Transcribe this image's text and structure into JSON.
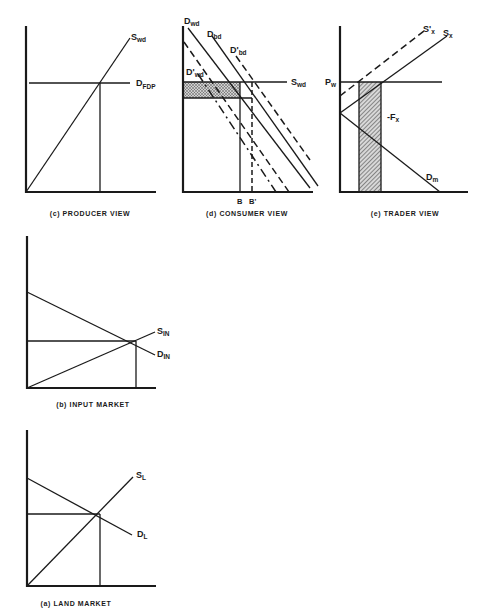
{
  "panels": {
    "c": {
      "caption": "(c) PRODUCER VIEW",
      "labels": {
        "supply": "S",
        "supply_sub": "wd",
        "demand": "D",
        "demand_sub": "FDP"
      }
    },
    "d": {
      "caption": "(d) CONSUMER VIEW",
      "labels": {
        "d_wd": "D",
        "d_wd_sub": "wd",
        "d_bd": "D",
        "d_bd_sub": "bd",
        "d_bd_prime": "D'",
        "d_bd_prime_sub": "bd",
        "d_wd_prime": "D'",
        "d_wd_prime_sub": "wd",
        "s_wd": "S",
        "s_wd_sub": "wd",
        "b": "B",
        "b_prime": "B'"
      }
    },
    "e": {
      "caption": "(e) TRADER VIEW",
      "labels": {
        "s_x_prime": "S'",
        "s_x_prime_sub": "x",
        "s_x": "S",
        "s_x_sub": "x",
        "p_w": "P",
        "p_w_sub": "w",
        "f_x": "-F",
        "f_x_sub": "x",
        "d_m": "D",
        "d_m_sub": "m"
      }
    },
    "b": {
      "caption": "(b) INPUT MARKET",
      "labels": {
        "supply": "S",
        "supply_sub": "IN",
        "demand": "D",
        "demand_sub": "IN"
      }
    },
    "a": {
      "caption": "(a) LAND MARKET",
      "labels": {
        "supply": "S",
        "supply_sub": "L",
        "demand": "D",
        "demand_sub": "L"
      }
    }
  },
  "colors": {
    "ink": "#1a1a1a",
    "background": "#ffffff"
  }
}
